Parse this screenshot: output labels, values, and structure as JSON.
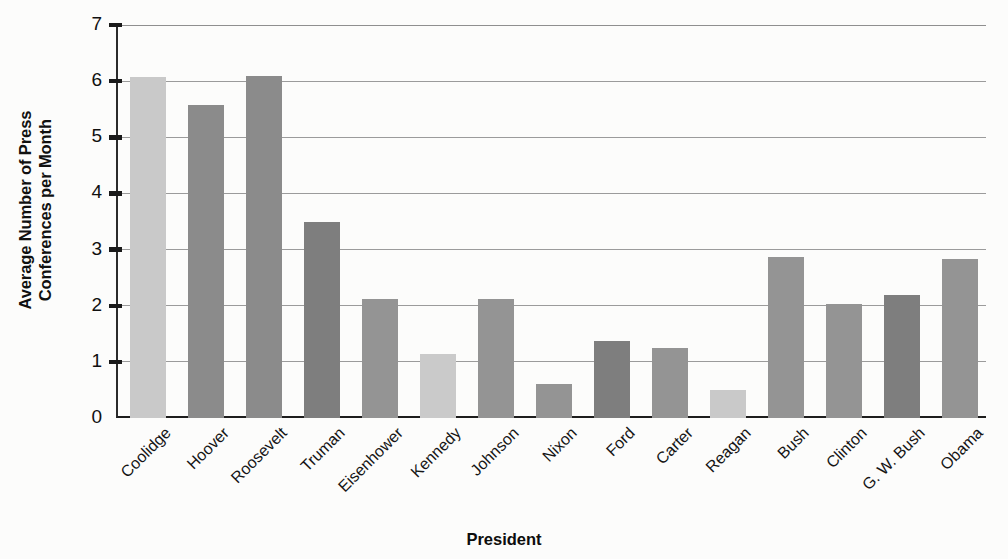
{
  "chart_data": {
    "type": "bar",
    "title": "",
    "xlabel": "President",
    "ylabel": "Average Number of Press Conferences per Month",
    "ylabel_line1": "Average Number of Press",
    "ylabel_line2": "Conferences per Month",
    "ylim": [
      0,
      7
    ],
    "yticks": [
      0,
      1,
      2,
      3,
      4,
      5,
      6,
      7
    ],
    "ytick_labels": [
      "0",
      "1",
      "2",
      "3",
      "4",
      "5",
      "6",
      "7"
    ],
    "grid": true,
    "grid_axis": "y",
    "legend": "none",
    "categories": [
      "Coolidge",
      "Hoover",
      "Roosevelt",
      "Truman",
      "Eisenhower",
      "Kennedy",
      "Johnson",
      "Nixon",
      "Ford",
      "Carter",
      "Reagan",
      "Bush",
      "Clinton",
      "G. W. Bush",
      "Obama"
    ],
    "values": [
      6.08,
      5.58,
      6.1,
      3.49,
      2.12,
      1.14,
      2.12,
      0.61,
      1.38,
      1.25,
      0.5,
      2.87,
      2.03,
      2.19,
      2.83
    ],
    "bar_colors": [
      "#c9c9c9",
      "#8b8b8b",
      "#8b8b8b",
      "#7e7e7e",
      "#949494",
      "#cacaca",
      "#949494",
      "#949494",
      "#7e7e7e",
      "#949494",
      "#c9c9c9",
      "#949494",
      "#949494",
      "#7e7e7e",
      "#949494"
    ]
  },
  "colors": {
    "light_gray": "#c9c9c9",
    "mid_gray": "#949494",
    "dark_gray": "#7e7e7e",
    "axis": "#1d1d1d",
    "grid": "#9b9b9b",
    "background": "#fcfcfb",
    "text": "#101010"
  }
}
